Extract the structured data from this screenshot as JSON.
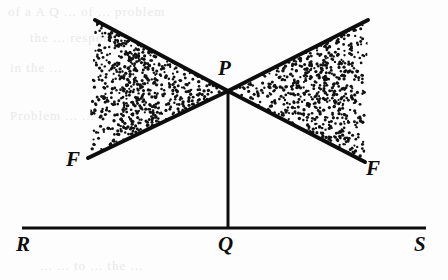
{
  "figure": {
    "background_color": "#fdfdfd",
    "ink_color": "#0d0d0d",
    "labels": {
      "P": "P",
      "F_left": "F",
      "F_right": "F",
      "R": "R",
      "Q": "Q",
      "S": "S"
    },
    "ghost_text": {
      "row1": "of a  A  Q  ... of  ...  problem",
      "row2": "the  ...  respond  ...",
      "row3": "in the  ...",
      "row4": "Problem   ...   ...",
      "row5": "...    ...    to  ...  the  ..."
    },
    "geometry": {
      "apex": {
        "x": 228,
        "y": 91
      },
      "left_upper_end": {
        "x": 95,
        "y": 20
      },
      "left_lower_end": {
        "x": 88,
        "y": 158
      },
      "right_upper_end": {
        "x": 368,
        "y": 20
      },
      "right_lower_end": {
        "x": 365,
        "y": 162
      },
      "baseline_left": {
        "x": 22,
        "y": 228
      },
      "baseline_right": {
        "x": 426,
        "y": 228
      },
      "foot": {
        "x": 228,
        "y": 228
      },
      "stroke_width": 4,
      "baseline_stroke_width": 3,
      "vertical_stroke_width": 3
    },
    "stipple": {
      "dot_color": "#111111",
      "dot_radius": 1.35,
      "left_count": 620,
      "right_count": 620,
      "seed": 20240517
    }
  }
}
